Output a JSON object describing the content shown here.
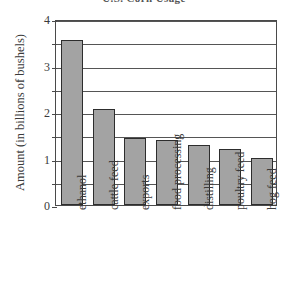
{
  "chart_data": {
    "type": "bar",
    "title": "U.S. Corn Usage",
    "xlabel": "",
    "ylabel": "Amount (in billions of bushels)",
    "categories": [
      "ethanol",
      "cattle feed",
      "exports",
      "food processing",
      "distilling",
      "poultry feed",
      "hog feed"
    ],
    "values": [
      3.55,
      2.06,
      1.44,
      1.4,
      1.29,
      1.2,
      1.01
    ],
    "ylim": [
      0,
      4
    ],
    "y_ticks": [
      0,
      1,
      2,
      3,
      4
    ],
    "y_tick_labels": [
      "0",
      "1",
      "2",
      "3",
      "4"
    ],
    "y_minor_ticks": [
      0.5,
      1.5,
      2.5,
      3.5
    ],
    "gridlines": [
      0.5,
      1,
      1.5,
      2,
      2.5,
      3,
      3.5,
      4
    ],
    "grid": true,
    "legend": "none",
    "bar_color": "#a3a3a3",
    "bar_border_color": "#2d2d2d",
    "axis_color": "#4a4a4a"
  },
  "chart": {
    "title": "U.S. Corn Usage",
    "y_axis_title": "Amount (in billions of bushels)"
  }
}
